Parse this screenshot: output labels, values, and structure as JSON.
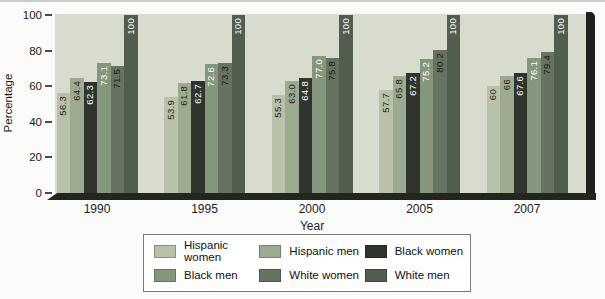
{
  "chart_data": {
    "type": "bar",
    "title": "",
    "xlabel": "Year",
    "ylabel": "Percentage",
    "ylim": [
      0,
      100
    ],
    "yticks": [
      0,
      20,
      40,
      60,
      80,
      100
    ],
    "grid": false,
    "legend_position": "bottom",
    "plot_background": "#d7dccf",
    "categories": [
      "1990",
      "1995",
      "2000",
      "2005",
      "2007"
    ],
    "series": [
      {
        "name": "Hispanic women",
        "color": "#b8c2aa",
        "label_color": "#1e221c",
        "values": [
          56.3,
          53.9,
          55.3,
          57.7,
          60
        ],
        "labels": [
          "56.3",
          "53.9",
          "55.3",
          "57.7",
          "60"
        ]
      },
      {
        "name": "Hispanic men",
        "color": "#9cab90",
        "label_color": "#1e221c",
        "values": [
          64.4,
          61.8,
          63.0,
          65.8,
          66
        ],
        "labels": [
          "64.4",
          "61.8",
          "63.0",
          "65.8",
          "66"
        ]
      },
      {
        "name": "Black women",
        "color": "#2f342e",
        "label_color": "#ffffff",
        "values": [
          62.3,
          62.7,
          64.8,
          67.2,
          67.6
        ],
        "labels": [
          "62.3",
          "62.7",
          "64.8",
          "67.2",
          "67.6"
        ]
      },
      {
        "name": "Black men",
        "color": "#84967c",
        "label_color": "#ffffff",
        "values": [
          73.1,
          72.6,
          77.0,
          75.2,
          76.1
        ],
        "labels": [
          "73.1",
          "72.6",
          "77.0",
          "75.2",
          "76.1"
        ]
      },
      {
        "name": "White women",
        "color": "#667362",
        "label_color": "#161915",
        "values": [
          71.5,
          73.3,
          75.8,
          80.2,
          79.4
        ],
        "labels": [
          "71.5",
          "73.3",
          "75.8",
          "80.2",
          "79.4"
        ]
      },
      {
        "name": "White men",
        "color": "#515d4f",
        "label_color": "#ffffff",
        "values": [
          100,
          100,
          100,
          100,
          100
        ],
        "labels": [
          "100",
          "100",
          "100",
          "100",
          "100"
        ]
      }
    ]
  }
}
